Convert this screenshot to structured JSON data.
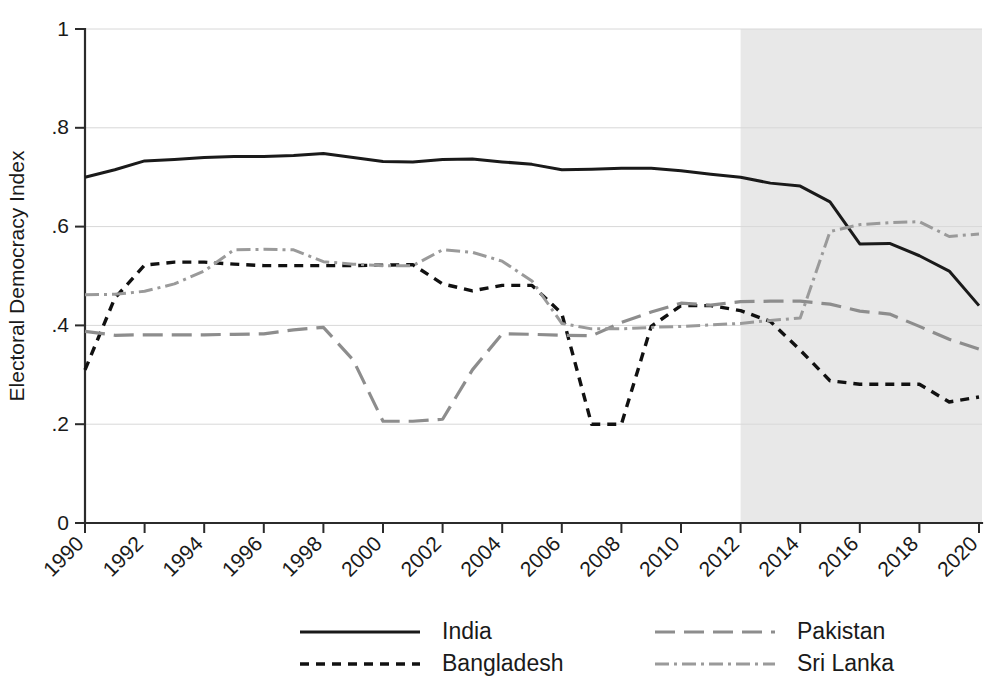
{
  "chart_data": {
    "type": "line",
    "title": "",
    "xlabel": "",
    "ylabel": "Electoral Democracy Index",
    "xlim": [
      1990,
      2020
    ],
    "ylim": [
      0,
      1
    ],
    "grid": true,
    "legend_position": "bottom",
    "y_ticks": [
      "0",
      ".2",
      ".4",
      ".6",
      ".8",
      "1"
    ],
    "y_tick_values": [
      0,
      0.2,
      0.4,
      0.6,
      0.8,
      1
    ],
    "x_ticks": [
      "1990",
      "1992",
      "1994",
      "1996",
      "1998",
      "2000",
      "2002",
      "2004",
      "2006",
      "2008",
      "2010",
      "2012",
      "2014",
      "2016",
      "2018",
      "2020"
    ],
    "x_tick_values": [
      1990,
      1992,
      1994,
      1996,
      1998,
      2000,
      2002,
      2004,
      2006,
      2008,
      2010,
      2012,
      2014,
      2016,
      2018,
      2020
    ],
    "x": [
      1990,
      1991,
      1992,
      1993,
      1994,
      1995,
      1996,
      1997,
      1998,
      1999,
      2000,
      2001,
      2002,
      2003,
      2004,
      2005,
      2006,
      2007,
      2008,
      2009,
      2010,
      2011,
      2012,
      2013,
      2014,
      2015,
      2016,
      2017,
      2018,
      2019,
      2020
    ],
    "annotations": [
      {
        "type": "shaded-region",
        "label": "shaded-period",
        "x_start": 2012,
        "x_end": 2020.2,
        "color": "#e8e8e8"
      }
    ],
    "series": [
      {
        "name": "India",
        "style": "solid",
        "color": "#1a1a1a",
        "values": [
          0.7,
          0.715,
          0.733,
          0.736,
          0.74,
          0.742,
          0.742,
          0.744,
          0.748,
          0.74,
          0.732,
          0.731,
          0.736,
          0.737,
          0.731,
          0.726,
          0.715,
          0.716,
          0.718,
          0.718,
          0.713,
          0.706,
          0.7,
          0.688,
          0.682,
          0.65,
          0.565,
          0.566,
          0.541,
          0.51,
          0.44
        ]
      },
      {
        "name": "Bangladesh",
        "style": "dotted",
        "color": "#111111",
        "values": [
          0.31,
          0.455,
          0.522,
          0.528,
          0.528,
          0.524,
          0.521,
          0.521,
          0.521,
          0.521,
          0.522,
          0.523,
          0.484,
          0.47,
          0.481,
          0.481,
          0.424,
          0.2,
          0.2,
          0.398,
          0.44,
          0.44,
          0.43,
          0.408,
          0.35,
          0.288,
          0.281,
          0.281,
          0.281,
          0.245,
          0.255
        ]
      },
      {
        "name": "Pakistan",
        "style": "dashed",
        "color": "#8d8d8d",
        "values": [
          0.388,
          0.38,
          0.381,
          0.381,
          0.381,
          0.382,
          0.383,
          0.391,
          0.396,
          0.33,
          0.206,
          0.206,
          0.21,
          0.31,
          0.383,
          0.382,
          0.38,
          0.379,
          0.406,
          0.427,
          0.445,
          0.441,
          0.448,
          0.449,
          0.449,
          0.443,
          0.429,
          0.423,
          0.398,
          0.372,
          0.352
        ]
      },
      {
        "name": "Sri Lanka",
        "style": "dashdot",
        "color": "#9a9a9a",
        "values": [
          0.462,
          0.463,
          0.469,
          0.484,
          0.51,
          0.553,
          0.554,
          0.553,
          0.529,
          0.524,
          0.521,
          0.521,
          0.553,
          0.548,
          0.53,
          0.49,
          0.404,
          0.393,
          0.393,
          0.396,
          0.398,
          0.401,
          0.404,
          0.41,
          0.415,
          0.59,
          0.604,
          0.608,
          0.61,
          0.58,
          0.585
        ]
      }
    ]
  },
  "legend": {
    "entries": [
      {
        "label": "India",
        "style": "solid",
        "color": "#1a1a1a"
      },
      {
        "label": "Pakistan",
        "style": "dashed",
        "color": "#8d8d8d"
      },
      {
        "label": "Bangladesh",
        "style": "dotted",
        "color": "#111111"
      },
      {
        "label": "Sri Lanka",
        "style": "dashdot",
        "color": "#9a9a9a"
      }
    ]
  }
}
